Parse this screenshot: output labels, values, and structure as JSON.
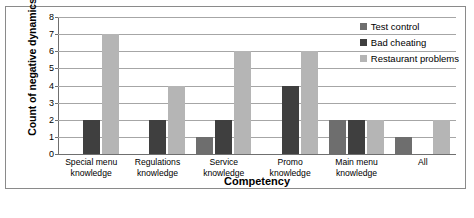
{
  "chart_data": {
    "type": "bar",
    "title": "",
    "xlabel": "Competency",
    "ylabel": "Count of negative dynamics",
    "ylim": [
      0,
      8
    ],
    "yticks": [
      "0",
      "1",
      "2",
      "3",
      "4",
      "5",
      "6",
      "7",
      "8"
    ],
    "grid": true,
    "legend_position": "top-right",
    "categories": [
      "Special menu knowledge",
      "Regulations knowledge",
      "Service knowledge",
      "Promo knowledge",
      "Main menu knowledge",
      "All"
    ],
    "category_lines": [
      [
        "Special menu",
        "knowledge"
      ],
      [
        "Regulations",
        "knowledge"
      ],
      [
        "Service",
        "knowledge"
      ],
      [
        "Promo knowledge",
        ""
      ],
      [
        "Main menu",
        "knowledge"
      ],
      [
        "All",
        ""
      ]
    ],
    "series": [
      {
        "name": "Test control",
        "color": "#6e6e6e",
        "values": [
          0,
          0,
          1,
          0,
          2,
          1
        ]
      },
      {
        "name": "Bad cheating",
        "color": "#3f3f3f",
        "values": [
          2,
          2,
          2,
          4,
          2,
          0
        ]
      },
      {
        "name": "Restaurant  problems",
        "color": "#b5b5b5",
        "values": [
          7,
          4,
          6,
          6,
          2,
          2
        ]
      }
    ]
  },
  "colors": {
    "frame": "#8a8a8a",
    "gridline": "#a6a6a6",
    "axis": "#6f6f6f",
    "background": "#ffffff",
    "text": "#000000"
  }
}
